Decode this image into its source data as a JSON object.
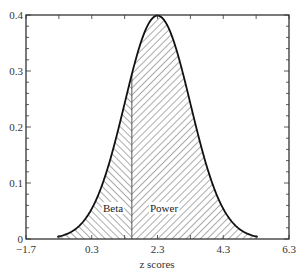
{
  "chart_data": {
    "type": "area",
    "title": "",
    "xlabel": "z  scores",
    "ylabel": "",
    "xlim": [
      -1.7,
      6.3
    ],
    "ylim": [
      0,
      0.4
    ],
    "x_ticks": [
      -1.7,
      0.3,
      2.3,
      4.3,
      6.3
    ],
    "x_tick_labels": [
      "−1.7",
      "0.3",
      "2.3",
      "4.3",
      "6.3"
    ],
    "y_ticks": [
      0,
      0.1,
      0.2,
      0.3,
      0.4
    ],
    "y_tick_labels": [
      "0",
      "0.1",
      "0.2",
      "0.3",
      "0.4"
    ],
    "grid": false,
    "series": [
      {
        "name": "Normal density",
        "distribution": "normal",
        "mean": 2.3,
        "sd": 1.0
      }
    ],
    "critical_value": 1.52,
    "regions": [
      {
        "name": "Beta",
        "label": "Beta",
        "from": -0.7,
        "to": 1.52,
        "hatch": "backslash"
      },
      {
        "name": "Power",
        "label": "Power",
        "from": 1.52,
        "to": 5.3,
        "hatch": "slash"
      }
    ]
  },
  "labels": {
    "beta": "Beta",
    "power": "Power",
    "xlabel": "z  scores"
  }
}
